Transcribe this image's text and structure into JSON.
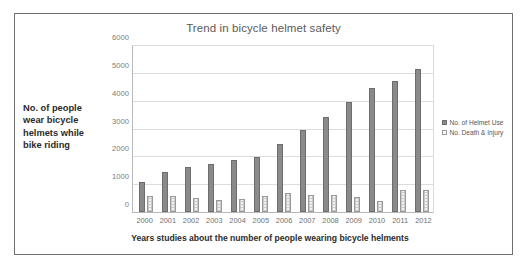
{
  "figure": {
    "title": "Trend in bicycle helmet safety",
    "y_axis_caption": "No. of people wear bicycle helmets while bike riding",
    "x_axis_caption": "Years studies about the number of people wearing bicycle helments"
  },
  "legend": {
    "position": "right",
    "items": [
      {
        "label": "No. of Helmet Use",
        "swatch": "filled-square-icon",
        "color": "#8a8a8a"
      },
      {
        "label": "No. Death & Injury",
        "swatch": "outlined-square-icon",
        "color": "#fafafa"
      }
    ]
  },
  "chart_data": {
    "type": "bar",
    "title": "Trend in bicycle helmet safety",
    "xlabel": "Years studies about the number of people wearing bicycle helments",
    "ylabel": "No. of people wear bicycle helmets while bike riding",
    "ylim": [
      0,
      6000
    ],
    "yticks": [
      0,
      1000,
      2000,
      3000,
      4000,
      5000,
      6000
    ],
    "ytick_labels": [
      "0",
      "1000",
      "2000",
      "3000",
      "4000",
      "5000",
      "6000"
    ],
    "grid": true,
    "legend_position": "right",
    "categories": [
      "2000",
      "2001",
      "2002",
      "2003",
      "2004",
      "2005",
      "2006",
      "2007",
      "2008",
      "2009",
      "2010",
      "2011",
      "2012"
    ],
    "series": [
      {
        "name": "No. of Helmet Use",
        "color": "#8a8a8a",
        "values": [
          1080,
          1450,
          1630,
          1750,
          1880,
          1980,
          2470,
          2970,
          3450,
          3970,
          4480,
          4740,
          5180
        ]
      },
      {
        "name": "No. Death & Injury",
        "color": "#fafafa",
        "values": [
          570,
          580,
          490,
          420,
          480,
          580,
          700,
          600,
          620,
          530,
          400,
          790,
          800
        ]
      }
    ]
  }
}
